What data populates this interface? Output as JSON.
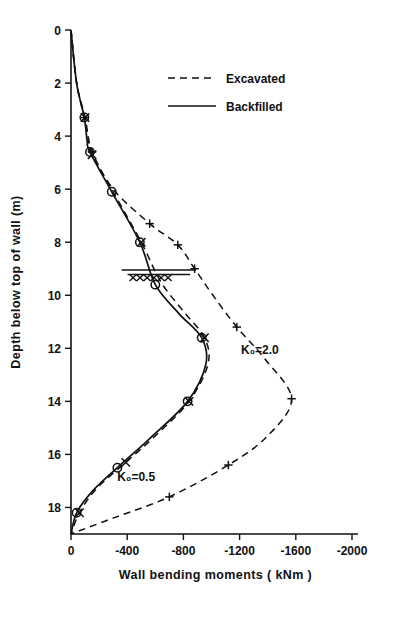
{
  "chart_data": {
    "type": "line",
    "title": "",
    "xlabel": "Wall bending moments ( kNm )",
    "ylabel": "Depth below top of wall (m)",
    "xlim": [
      0,
      -2200
    ],
    "ylim": [
      0,
      19
    ],
    "xticks": [
      "0",
      "-400",
      "-800",
      "-1200",
      "-1600",
      "-2000"
    ],
    "xtick_values": [
      0,
      -400,
      -800,
      -1200,
      -1600,
      -2000
    ],
    "yticks": [
      "0",
      "2",
      "4",
      "6",
      "8",
      "10",
      "12",
      "14",
      "16",
      "18"
    ],
    "ytick_values": [
      0,
      2,
      4,
      6,
      8,
      10,
      12,
      14,
      16,
      18
    ],
    "grid": false,
    "legend_position": "top-right",
    "legend": [
      {
        "label": "Excavated",
        "style": "dashed"
      },
      {
        "label": "Backfilled",
        "style": "solid"
      }
    ],
    "annotations": [
      {
        "text": "K₀=2.0",
        "x": -1210,
        "y": 12.2
      },
      {
        "text": "K₀=0.5",
        "x": -330,
        "y": 17.0
      },
      {
        "text": "water-table-symbol",
        "x": -620,
        "y": 9.1
      }
    ],
    "series": [
      {
        "name": "Excavated K0=2.0",
        "style": "dashed",
        "marker": "plus",
        "points": [
          {
            "m": 0,
            "d": 0.0
          },
          {
            "m": -40,
            "d": 2.0
          },
          {
            "m": -95,
            "d": 3.3
          },
          {
            "m": -120,
            "d": 4.0
          },
          {
            "m": -150,
            "d": 4.6
          },
          {
            "m": -300,
            "d": 6.0
          },
          {
            "m": -560,
            "d": 7.3
          },
          {
            "m": -760,
            "d": 8.1
          },
          {
            "m": -880,
            "d": 9.0
          },
          {
            "m": -1010,
            "d": 10.0
          },
          {
            "m": -1180,
            "d": 11.2
          },
          {
            "m": -1380,
            "d": 12.4
          },
          {
            "m": -1570,
            "d": 13.9
          },
          {
            "m": -1400,
            "d": 15.3
          },
          {
            "m": -1120,
            "d": 16.4
          },
          {
            "m": -700,
            "d": 17.6
          },
          {
            "m": -300,
            "d": 18.4
          },
          {
            "m": 0,
            "d": 19.0
          }
        ],
        "markers": [
          {
            "m": -95,
            "d": 3.3
          },
          {
            "m": -150,
            "d": 4.6
          },
          {
            "m": -560,
            "d": 7.3
          },
          {
            "m": -760,
            "d": 8.1
          },
          {
            "m": -880,
            "d": 9.0
          },
          {
            "m": -1180,
            "d": 11.2
          },
          {
            "m": -1570,
            "d": 13.9
          },
          {
            "m": -1120,
            "d": 16.4
          },
          {
            "m": -700,
            "d": 17.6
          }
        ]
      },
      {
        "name": "Backfilled K0=0.5",
        "style": "solid",
        "marker": "circle",
        "points": [
          {
            "m": 0,
            "d": 0.0
          },
          {
            "m": -40,
            "d": 2.0
          },
          {
            "m": -95,
            "d": 3.3
          },
          {
            "m": -115,
            "d": 4.2
          },
          {
            "m": -135,
            "d": 4.6
          },
          {
            "m": -290,
            "d": 6.1
          },
          {
            "m": -490,
            "d": 8.0
          },
          {
            "m": -600,
            "d": 9.6
          },
          {
            "m": -770,
            "d": 10.7
          },
          {
            "m": -930,
            "d": 11.6
          },
          {
            "m": -960,
            "d": 12.6
          },
          {
            "m": -830,
            "d": 14.0
          },
          {
            "m": -560,
            "d": 15.4
          },
          {
            "m": -330,
            "d": 16.5
          },
          {
            "m": -150,
            "d": 17.4
          },
          {
            "m": -40,
            "d": 18.2
          },
          {
            "m": 0,
            "d": 19.0
          }
        ],
        "markers": [
          {
            "m": -95,
            "d": 3.3
          },
          {
            "m": -135,
            "d": 4.6
          },
          {
            "m": -290,
            "d": 6.1
          },
          {
            "m": -490,
            "d": 8.0
          },
          {
            "m": -600,
            "d": 9.6
          },
          {
            "m": -930,
            "d": 11.6
          },
          {
            "m": -830,
            "d": 14.0
          },
          {
            "m": -330,
            "d": 16.5
          },
          {
            "m": -40,
            "d": 18.2
          }
        ]
      },
      {
        "name": "Excavated K0=0.5",
        "style": "dashed",
        "marker": "cross",
        "points": [
          {
            "m": 0,
            "d": 0.0
          },
          {
            "m": -40,
            "d": 2.0
          },
          {
            "m": -100,
            "d": 3.3
          },
          {
            "m": -125,
            "d": 4.1
          },
          {
            "m": -150,
            "d": 4.7
          },
          {
            "m": -300,
            "d": 6.1
          },
          {
            "m": -500,
            "d": 8.0
          },
          {
            "m": -640,
            "d": 9.5
          },
          {
            "m": -800,
            "d": 10.6
          },
          {
            "m": -950,
            "d": 11.6
          },
          {
            "m": -975,
            "d": 12.6
          },
          {
            "m": -840,
            "d": 14.0
          },
          {
            "m": -600,
            "d": 15.3
          },
          {
            "m": -390,
            "d": 16.3
          },
          {
            "m": -180,
            "d": 17.3
          },
          {
            "m": -60,
            "d": 18.2
          },
          {
            "m": 0,
            "d": 19.0
          }
        ],
        "markers": [
          {
            "m": -100,
            "d": 3.3
          },
          {
            "m": -150,
            "d": 4.7
          },
          {
            "m": -500,
            "d": 8.0
          },
          {
            "m": -950,
            "d": 11.6
          },
          {
            "m": -840,
            "d": 14.0
          },
          {
            "m": -390,
            "d": 16.3
          },
          {
            "m": -60,
            "d": 18.2
          }
        ]
      }
    ]
  }
}
